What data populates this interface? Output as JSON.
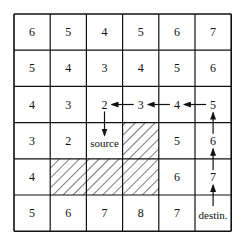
{
  "grid": {
    "rows": 6,
    "cols": 6,
    "origin_x": 14,
    "origin_y": 14,
    "cell_w": 36.2,
    "cell_h": 36.2,
    "line_color": "#111111",
    "cells": [
      [
        "6",
        "5",
        "4",
        "5",
        "6",
        "7"
      ],
      [
        "5",
        "4",
        "3",
        "4",
        "5",
        "6"
      ],
      [
        "4",
        "3",
        "2",
        "3",
        "4",
        "5"
      ],
      [
        "3",
        "2",
        "source",
        "",
        "5",
        "6"
      ],
      [
        "4",
        "",
        "",
        "",
        "6",
        "7"
      ],
      [
        "5",
        "6",
        "7",
        "8",
        "7",
        "destin."
      ]
    ],
    "obstacles": [
      {
        "row": 3,
        "col": 3
      },
      {
        "row": 4,
        "col": 1
      },
      {
        "row": 4,
        "col": 2
      },
      {
        "row": 4,
        "col": 3
      }
    ]
  },
  "path": {
    "description": "Backtrace from destination to source",
    "steps": [
      {
        "from": {
          "row": 5,
          "col": 5
        },
        "to": {
          "row": 4,
          "col": 5
        },
        "dir": "up"
      },
      {
        "from": {
          "row": 4,
          "col": 5
        },
        "to": {
          "row": 3,
          "col": 5
        },
        "dir": "up"
      },
      {
        "from": {
          "row": 3,
          "col": 5
        },
        "to": {
          "row": 2,
          "col": 5
        },
        "dir": "up"
      },
      {
        "from": {
          "row": 2,
          "col": 5
        },
        "to": {
          "row": 2,
          "col": 4
        },
        "dir": "left"
      },
      {
        "from": {
          "row": 2,
          "col": 4
        },
        "to": {
          "row": 2,
          "col": 3
        },
        "dir": "left"
      },
      {
        "from": {
          "row": 2,
          "col": 3
        },
        "to": {
          "row": 2,
          "col": 2
        },
        "dir": "left"
      },
      {
        "from": {
          "row": 2,
          "col": 2
        },
        "to": {
          "row": 3,
          "col": 2
        },
        "dir": "down"
      }
    ]
  },
  "labels": {
    "source": "source",
    "destination": "destin."
  }
}
